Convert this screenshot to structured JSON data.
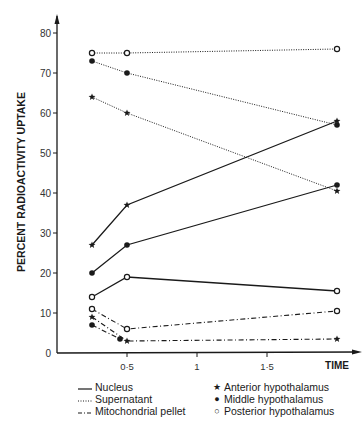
{
  "chart_data": {
    "type": "line",
    "title": "",
    "xlabel": "TIME",
    "ylabel": "PERCENT RADIOACTIVITY UPTAKE",
    "xlim": [
      0,
      2.1
    ],
    "ylim": [
      0,
      85
    ],
    "x_ticks": [
      {
        "v": 0.5,
        "label": "0·5"
      },
      {
        "v": 1,
        "label": "1"
      },
      {
        "v": 1.5,
        "label": "1·5"
      }
    ],
    "y_ticks": [
      {
        "v": 0,
        "label": "0"
      },
      {
        "v": 10,
        "label": "10"
      },
      {
        "v": 20,
        "label": "20"
      },
      {
        "v": 30,
        "label": "30"
      },
      {
        "v": 40,
        "label": "40"
      },
      {
        "v": 50,
        "label": "50"
      },
      {
        "v": 60,
        "label": "60"
      },
      {
        "v": 70,
        "label": "70"
      },
      {
        "v": 80,
        "label": "80"
      }
    ],
    "grid": false,
    "legend_position": "bottom",
    "fractions": [
      {
        "name": "Nucleus",
        "style": "solid"
      },
      {
        "name": "Supernatant",
        "style": "dotted"
      },
      {
        "name": "Mitochondrial pellet",
        "style": "dashdot"
      }
    ],
    "regions": [
      {
        "name": "Anterior hypothalamus",
        "marker": "star",
        "symbol": "★"
      },
      {
        "name": "Middle hypothalamus",
        "marker": "filled-circle",
        "symbol": "●"
      },
      {
        "name": "Posterior hypothalamus",
        "marker": "open-circle",
        "symbol": "○"
      }
    ],
    "series": [
      {
        "name": "Nucleus – Anterior hypothalamus",
        "fraction": "Nucleus",
        "region": "Anterior hypothalamus",
        "style": "solid",
        "marker": "star",
        "x": [
          0.25,
          0.5,
          2
        ],
        "y": [
          27,
          37,
          58
        ]
      },
      {
        "name": "Nucleus – Middle hypothalamus",
        "fraction": "Nucleus",
        "region": "Middle hypothalamus",
        "style": "solid",
        "marker": "filled-circle",
        "x": [
          0.25,
          0.5,
          2
        ],
        "y": [
          20,
          27,
          42
        ]
      },
      {
        "name": "Nucleus – Posterior hypothalamus",
        "fraction": "Nucleus",
        "region": "Posterior hypothalamus",
        "style": "solid",
        "marker": "open-circle",
        "x": [
          0.25,
          0.5,
          2
        ],
        "y": [
          14,
          19,
          15.5
        ]
      },
      {
        "name": "Supernatant – Anterior hypothalamus",
        "fraction": "Supernatant",
        "region": "Anterior hypothalamus",
        "style": "dotted",
        "marker": "star",
        "x": [
          0.25,
          0.5,
          2
        ],
        "y": [
          64,
          60,
          40.5
        ]
      },
      {
        "name": "Supernatant – Middle hypothalamus",
        "fraction": "Supernatant",
        "region": "Middle hypothalamus",
        "style": "dotted",
        "marker": "filled-circle",
        "x": [
          0.25,
          0.5,
          2
        ],
        "y": [
          73,
          70,
          57
        ]
      },
      {
        "name": "Supernatant – Posterior hypothalamus",
        "fraction": "Supernatant",
        "region": "Posterior hypothalamus",
        "style": "dotted",
        "marker": "open-circle",
        "x": [
          0.25,
          0.5,
          2
        ],
        "y": [
          75,
          75,
          76
        ]
      },
      {
        "name": "Mitochondrial pellet – Anterior hypothalamus",
        "fraction": "Mitochondrial pellet",
        "region": "Anterior hypothalamus",
        "style": "dashdot",
        "marker": "star",
        "x": [
          0.25,
          0.5,
          2
        ],
        "y": [
          9,
          3,
          3.5
        ]
      },
      {
        "name": "Mitochondrial pellet – Middle hypothalamus",
        "fraction": "Mitochondrial pellet",
        "region": "Middle hypothalamus",
        "style": "dashdot",
        "marker": "filled-circle",
        "x": [
          0.25,
          0.45
        ],
        "y": [
          7,
          3.5
        ]
      },
      {
        "name": "Mitochondrial pellet – Posterior hypothalamus",
        "fraction": "Mitochondrial pellet",
        "region": "Posterior hypothalamus",
        "style": "dashdot",
        "marker": "open-circle",
        "x": [
          0.25,
          0.5,
          2
        ],
        "y": [
          11,
          6,
          10.5
        ]
      }
    ]
  },
  "legend": {
    "fractions": [
      "Nucleus",
      "Supernatant",
      "Mitochondrial pellet"
    ],
    "regions": [
      "Anterior hypothalamus",
      "Middle hypothalamus",
      "Posterior hypothalamus"
    ],
    "region_symbols": [
      "★",
      "●",
      "○"
    ]
  },
  "colors": {
    "ink": "#1a1a1a",
    "background": "#ffffff"
  }
}
